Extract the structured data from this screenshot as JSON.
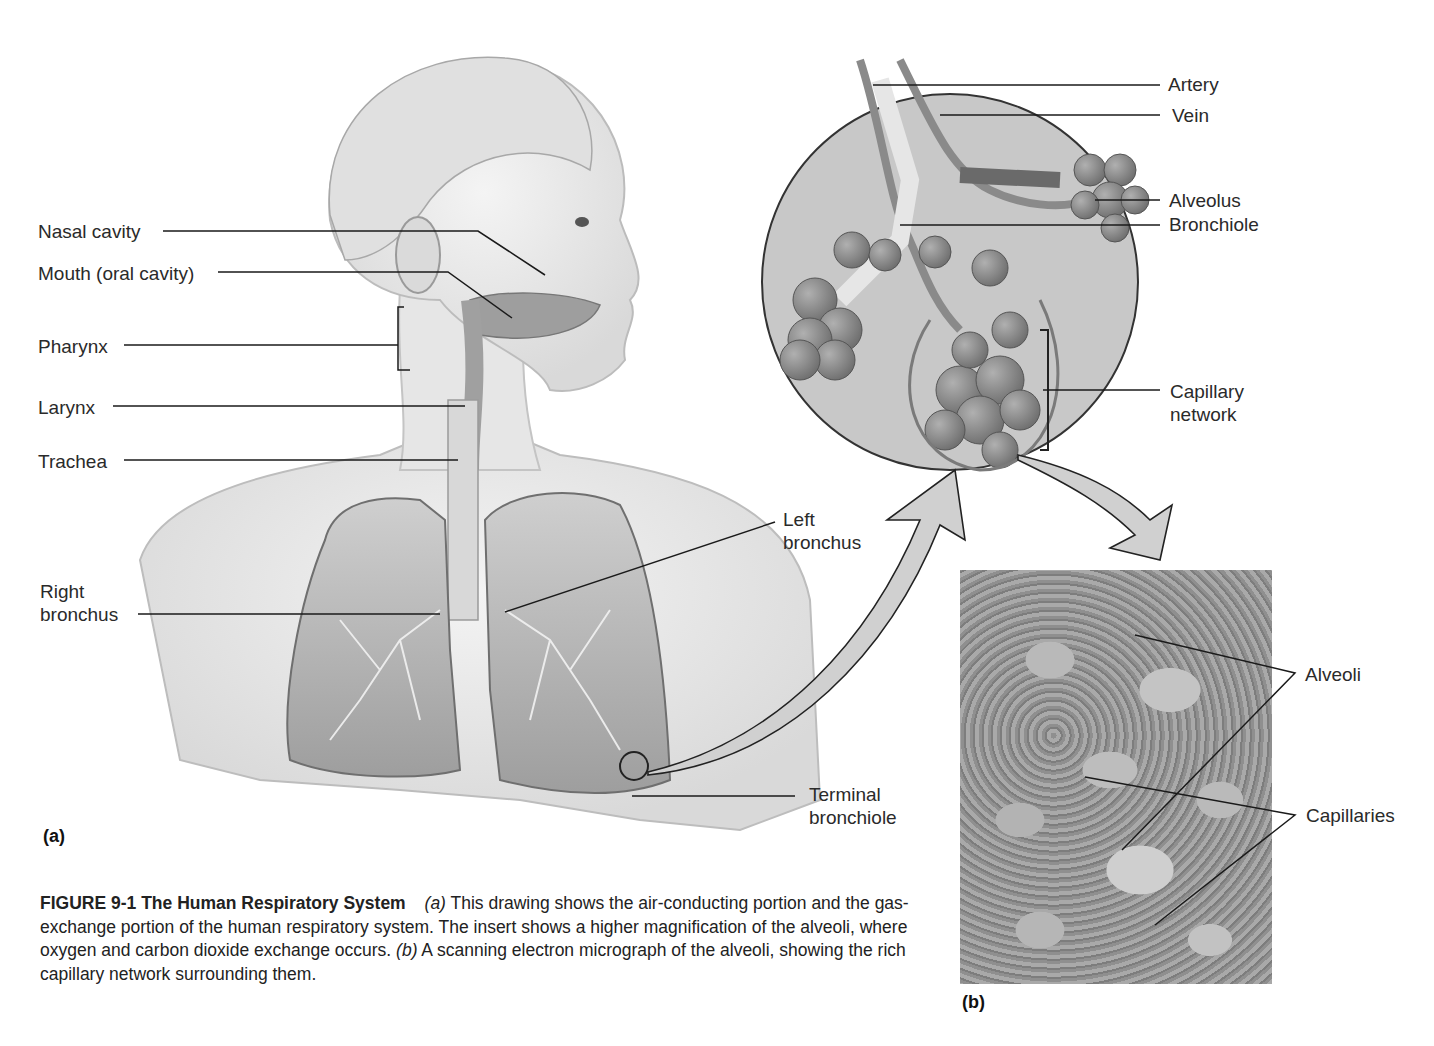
{
  "figure": {
    "number": "FIGURE 9-1",
    "title": "The Human Respiratory System",
    "caption_parts": [
      {
        "type": "italic",
        "text": "(a)"
      },
      {
        "type": "text",
        "text": " This drawing shows the air-conducting portion and the gas-exchange portion of the human respiratory system. The insert shows a higher magnification of the alveoli, where oxygen and carbon dioxide exchange occurs. "
      },
      {
        "type": "italic",
        "text": "(b)"
      },
      {
        "type": "text",
        "text": " A scanning electron micrograph of the alveoli, showing the rich capillary network surrounding them."
      }
    ]
  },
  "panels": {
    "a": {
      "tag": "(a)"
    },
    "b": {
      "tag": "(b)"
    }
  },
  "labels_left": {
    "nasal_cavity": "Nasal cavity",
    "mouth": "Mouth (oral cavity)",
    "pharynx": "Pharynx",
    "larynx": "Larynx",
    "trachea": "Trachea",
    "right_bronchus": "Right\nbronchus"
  },
  "labels_center": {
    "left_bronchus": "Left\nbronchus",
    "terminal_bronchiole": "Terminal\nbronchiole"
  },
  "labels_insert": {
    "artery": "Artery",
    "vein": "Vein",
    "alveolus": "Alveolus",
    "bronchiole": "Bronchiole",
    "capillary_network": "Capillary\nnetwork"
  },
  "labels_micrograph": {
    "alveoli": "Alveoli",
    "capillaries": "Capillaries"
  },
  "colors": {
    "insert_circle": "#c8c8c8",
    "arrow_fill": "#d0d0d0",
    "leader_line": "#1a1a1a",
    "micrograph": "#9a9a9a"
  }
}
